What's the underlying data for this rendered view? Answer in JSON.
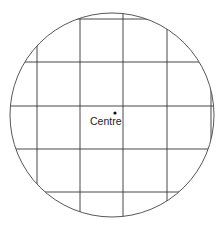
{
  "diagram": {
    "title_cutoff": "",
    "centre_label": "Centre",
    "circle": {
      "cx": 112,
      "cy": 115,
      "r": 102
    },
    "vertical_lines_x": [
      37,
      80,
      123,
      167,
      211
    ],
    "horizontal_lines_y": [
      19,
      62,
      106,
      149,
      192
    ],
    "centre_point": {
      "x": 115,
      "y": 113
    },
    "line_color": "#333333"
  }
}
